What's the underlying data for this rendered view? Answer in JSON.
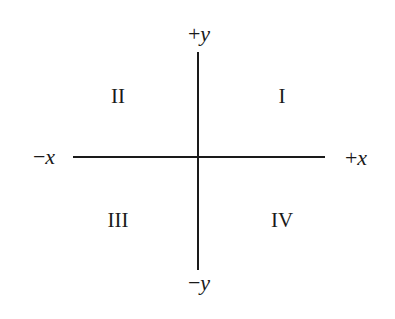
{
  "diagram": {
    "type": "coordinate-quadrants",
    "axes": {
      "pos_y": {
        "sign": "+",
        "var": "y"
      },
      "neg_y": {
        "sign": "−",
        "var": "y"
      },
      "neg_x": {
        "sign": "−",
        "var": "x"
      },
      "pos_x": {
        "sign": "+",
        "var": "x"
      }
    },
    "quadrants": {
      "q1": "I",
      "q2": "II",
      "q3": "III",
      "q4": "IV"
    },
    "colors": {
      "line": "#1a1a1a",
      "background": "#ffffff"
    }
  }
}
